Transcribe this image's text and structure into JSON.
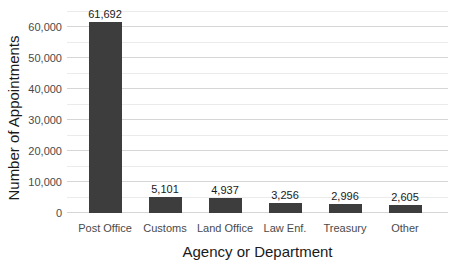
{
  "chart_data": {
    "type": "bar",
    "title": "",
    "xlabel": "Agency or Department",
    "ylabel": "Number of Appointments",
    "categories": [
      "Post Office",
      "Customs",
      "Land Office",
      "Law Enf.",
      "Treasury",
      "Other"
    ],
    "values": [
      61692,
      5101,
      4937,
      3256,
      2996,
      2605
    ],
    "value_labels": [
      "61,692",
      "5,101",
      "4,937",
      "3,256",
      "2,996",
      "2,605"
    ],
    "y_tick_labels": [
      "0",
      "10,000",
      "20,000",
      "30,000",
      "40,000",
      "50,000",
      "60,000"
    ],
    "ylim": [
      0,
      65000
    ],
    "grid": {
      "on": true,
      "major_step": 10000,
      "minor_step": 5000
    },
    "legend": "none",
    "colors": {
      "bar": "#3d3d3d",
      "grid_major": "#d6d6d6",
      "grid_minor": "#ebebeb",
      "tick_label": "#4a4a4a",
      "axis_title": "#1a1a1a",
      "value_label": "#1a1a1a",
      "background": "#ffffff"
    }
  }
}
